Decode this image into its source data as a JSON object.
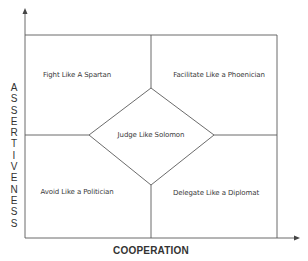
{
  "diagram": {
    "y_axis_label": "ASSERTIVENESS",
    "y_axis_letters": [
      "A",
      "S",
      "S",
      "E",
      "R",
      "T",
      "I",
      "V",
      "E",
      "N",
      "E",
      "S",
      "S"
    ],
    "x_axis_label": "COOPERATION",
    "quadrants": {
      "top_left": "Fight Like A Spartan",
      "top_right": "Facilitate Like a Phoenician",
      "bottom_left": "Avoid Like a Politician",
      "bottom_right": "Delegate Like a Diplomat"
    },
    "center": "Judge Like Solomon",
    "line_color": "#555555"
  }
}
